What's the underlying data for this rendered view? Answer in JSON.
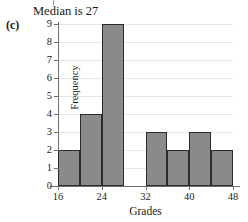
{
  "figure": {
    "label": "(c)",
    "title": "Median is 27"
  },
  "chart_data": {
    "type": "bar",
    "title": "Median is 27",
    "xlabel": "Grades",
    "ylabel": "Frequency",
    "bin_width": 4,
    "bin_edges": [
      16,
      20,
      24,
      28,
      32,
      36,
      40,
      44,
      48
    ],
    "categories": [
      "16-20",
      "20-24",
      "24-28",
      "28-32",
      "32-36",
      "36-40",
      "40-44",
      "44-48"
    ],
    "values": [
      2,
      4,
      9,
      0,
      3,
      2,
      3,
      2
    ],
    "xlim": [
      16,
      48
    ],
    "ylim": [
      0,
      9
    ],
    "x_ticks": [
      16,
      24,
      32,
      40,
      48
    ],
    "y_ticks": [
      0,
      1,
      2,
      3,
      4,
      5,
      6,
      7,
      8,
      9
    ],
    "grid": "horizontal",
    "legend": null,
    "bar_color": "#8a8a8a",
    "bar_edge_color": "#2b2b2b",
    "gridline_color": "#e6e6e6",
    "axis_color": "#6e6e6e"
  }
}
